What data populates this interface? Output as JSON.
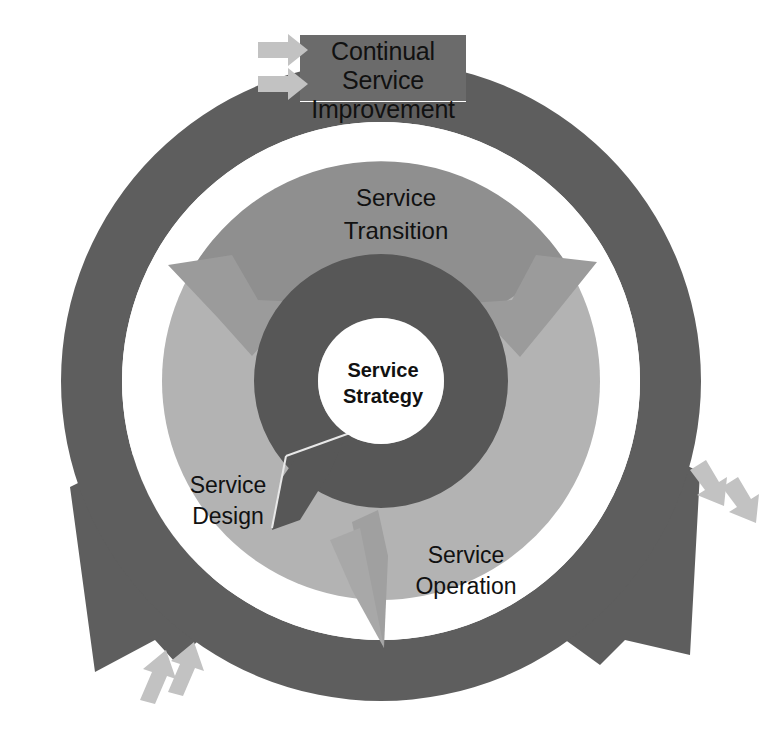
{
  "diagram": {
    "type": "concentric-ring-cycle",
    "background_color": "#ffffff"
  },
  "core": {
    "name": "service-strategy",
    "label_line1": "Service",
    "label_line2": "Strategy",
    "fill": "#ffffff",
    "text_color": "#111111"
  },
  "inner_ring": {
    "name": "strategy-ring",
    "fill": "#575757",
    "arrow_direction": "counter-clockwise"
  },
  "middle_ring": {
    "name": "service-lifecycle-disc",
    "segments": [
      {
        "name": "service-transition",
        "label_line1": "Service",
        "label_line2": "Transition",
        "fill": "#8f8f8f",
        "text_color": "#111111"
      },
      {
        "name": "service-design",
        "label_line1": "Service",
        "label_line2": "Design",
        "fill": "#b3b3b3",
        "text_color": "#111111"
      },
      {
        "name": "service-operation",
        "label_line1": "Service",
        "label_line2": "Operation",
        "fill": "#b3b3b3",
        "text_color": "#111111"
      }
    ]
  },
  "outer_ring": {
    "name": "continual-service-improvement",
    "fill": "#5e5e5e",
    "label_box": {
      "line1": "Continual",
      "line2": "Service",
      "line3": "Improvement",
      "fill": "#6b6b6b",
      "text_color": "#111111"
    }
  },
  "feeder_arrows": {
    "fill": "#c2c2c2",
    "groups": [
      {
        "name": "feeder-arrows-top-left",
        "count": 2,
        "direction": "right"
      },
      {
        "name": "feeder-arrows-right",
        "count": 2,
        "direction": "down-right"
      },
      {
        "name": "feeder-arrows-bottom-left",
        "count": 2,
        "direction": "up-right"
      }
    ]
  },
  "gap_ring": {
    "name": "white-separator-ring",
    "fill": "#ffffff"
  }
}
